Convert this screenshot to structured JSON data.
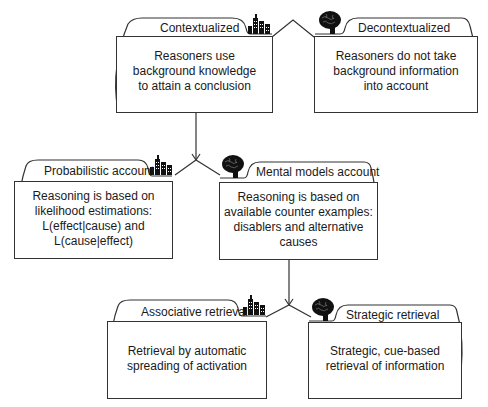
{
  "diagram": {
    "level1": {
      "left": {
        "label": "Contextualized",
        "icon": "city-icon",
        "text": [
          "Reasoners use",
          "background knowledge",
          "to attain a conclusion"
        ]
      },
      "right": {
        "label": "Decontextualized",
        "icon": "brain-icon",
        "text": [
          "Reasoners do not take",
          "background information",
          "into account"
        ]
      }
    },
    "level2": {
      "left": {
        "label": "Probabilistic account",
        "icon": "city-icon",
        "text": [
          "Reasoning is based on",
          "likelihood estimations:",
          "L(effect|cause) and",
          "L(cause|effect)"
        ]
      },
      "right": {
        "label": "Mental models account",
        "icon": "brain-icon",
        "text": [
          "Reasoning is based on",
          "available counter examples:",
          "disablers and alternative",
          "causes"
        ]
      }
    },
    "level3": {
      "left": {
        "label": "Associative retrieval",
        "icon": "city-icon",
        "text": [
          "Retrieval by automatic",
          "spreading of activation"
        ]
      },
      "right": {
        "label": "Strategic retrieval",
        "icon": "brain-icon",
        "text": [
          "Strategic, cue-based",
          "retrieval of information"
        ]
      }
    }
  },
  "colors": {
    "stroke": "#333333",
    "text": "#1a1a1a",
    "background": "#ffffff"
  }
}
